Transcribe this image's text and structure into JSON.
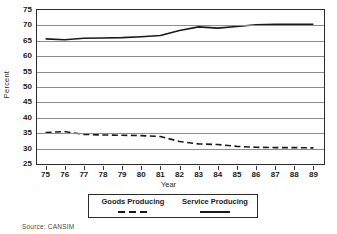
{
  "chart_data": {
    "type": "line",
    "title": "",
    "xlabel": "Year",
    "ylabel": "Percent",
    "xlim": [
      74.5,
      89.5
    ],
    "ylim": [
      25,
      75
    ],
    "yticks": [
      75,
      70,
      65,
      60,
      55,
      50,
      45,
      40,
      35,
      30,
      25
    ],
    "grid": true,
    "legend_position": "below",
    "x": [
      75,
      76,
      77,
      78,
      79,
      80,
      81,
      82,
      83,
      84,
      85,
      86,
      87,
      88,
      89
    ],
    "xticklabels": [
      "75",
      "76",
      "77",
      "78",
      "79",
      "80",
      "81",
      "82",
      "83",
      "84",
      "85",
      "86",
      "87",
      "88",
      "89"
    ],
    "series": [
      {
        "name": "Goods Producing",
        "style": "dashed",
        "color": "#1a1a1a",
        "values": [
          34.9,
          35.2,
          34.3,
          34.1,
          34.0,
          33.9,
          33.6,
          32.0,
          31.2,
          31.0,
          30.4,
          30.1,
          30.0,
          30.0,
          29.9
        ]
      },
      {
        "name": "Service Producing",
        "style": "solid",
        "color": "#1a1a1a",
        "values": [
          65.3,
          65.0,
          65.5,
          65.6,
          65.7,
          66.0,
          66.4,
          68.0,
          69.2,
          68.8,
          69.3,
          69.9,
          70.0,
          70.0,
          70.0
        ]
      }
    ]
  },
  "legend": {
    "goods_label": "Goods Producing",
    "service_label": "Service Producing"
  },
  "footer": {
    "source": "Source: CANSIM"
  }
}
